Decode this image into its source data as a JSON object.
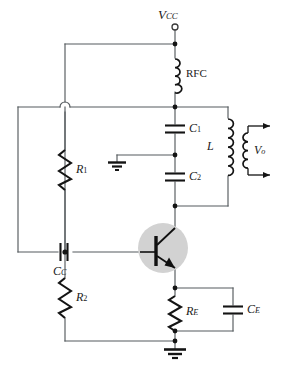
{
  "diagram": {
    "type": "schematic",
    "background_color": "#ffffff",
    "wire_color": "#555a5e",
    "component_color": "#141414",
    "transistor_halo_color": "#d2d2d2"
  },
  "labels": {
    "vcc": {
      "symbol": "V",
      "subscript": "CC",
      "name": "supply-voltage"
    },
    "rfc": {
      "symbol": "RFC",
      "subscript": "",
      "name": "rf-choke"
    },
    "c1": {
      "symbol": "C",
      "subscript": "1",
      "name": "capacitor-c1"
    },
    "c2": {
      "symbol": "C",
      "subscript": "2",
      "name": "capacitor-c2"
    },
    "l": {
      "symbol": "L",
      "subscript": "",
      "name": "tank-inductor"
    },
    "vo": {
      "symbol": "V",
      "subscript": "o",
      "name": "output-voltage"
    },
    "r1": {
      "symbol": "R",
      "subscript": "1",
      "name": "bias-resistor-r1"
    },
    "r2": {
      "symbol": "R",
      "subscript": "2",
      "name": "bias-resistor-r2"
    },
    "cc": {
      "symbol": "C",
      "subscript": "C",
      "name": "coupling-capacitor"
    },
    "re": {
      "symbol": "R",
      "subscript": "E",
      "name": "emitter-resistor"
    },
    "ce": {
      "symbol": "C",
      "subscript": "E",
      "name": "emitter-bypass-capacitor"
    }
  },
  "components": [
    {
      "id": "vcc-terminal",
      "kind": "open-terminal",
      "label": "V_CC"
    },
    {
      "id": "rfc",
      "kind": "inductor",
      "label": "RFC",
      "turns": 4
    },
    {
      "id": "c1",
      "kind": "capacitor",
      "label": "C_1",
      "orientation": "horizontal-plates"
    },
    {
      "id": "c2",
      "kind": "capacitor",
      "label": "C_2",
      "orientation": "horizontal-plates"
    },
    {
      "id": "l-primary",
      "kind": "inductor",
      "label": "L",
      "turns": 6
    },
    {
      "id": "l-secondary",
      "kind": "inductor",
      "label": "",
      "turns": 4
    },
    {
      "id": "r1",
      "kind": "resistor",
      "label": "R_1",
      "zigzags": 5
    },
    {
      "id": "r2",
      "kind": "resistor",
      "label": "R_2",
      "zigzags": 5
    },
    {
      "id": "cc",
      "kind": "capacitor",
      "label": "C_C",
      "orientation": "vertical-plates"
    },
    {
      "id": "re",
      "kind": "resistor",
      "label": "R_E",
      "zigzags": 5
    },
    {
      "id": "ce",
      "kind": "capacitor",
      "label": "C_E",
      "orientation": "horizontal-plates"
    },
    {
      "id": "q1",
      "kind": "npn-transistor",
      "label": ""
    },
    {
      "id": "gnd-signal",
      "kind": "ground",
      "label": ""
    },
    {
      "id": "gnd-main",
      "kind": "ground",
      "label": ""
    },
    {
      "id": "wire-hop",
      "kind": "crossover",
      "label": ""
    }
  ],
  "output_arrows": {
    "count": 2,
    "direction": "right",
    "label": "V_o"
  }
}
